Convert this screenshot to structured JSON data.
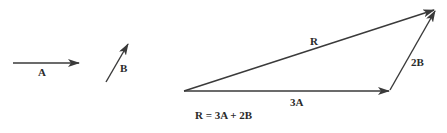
{
  "diagram": {
    "colors": {
      "line": "#3a3a3a",
      "text": "#2a2a2a",
      "background": "#ffffff"
    },
    "vectors": [
      {
        "id": "A",
        "label": "A"
      },
      {
        "id": "B",
        "label": "B"
      },
      {
        "id": "3A",
        "label": "3A"
      },
      {
        "id": "2B",
        "label": "2B"
      },
      {
        "id": "R",
        "label": "R"
      }
    ],
    "equation": "R = 3A + 2B"
  }
}
